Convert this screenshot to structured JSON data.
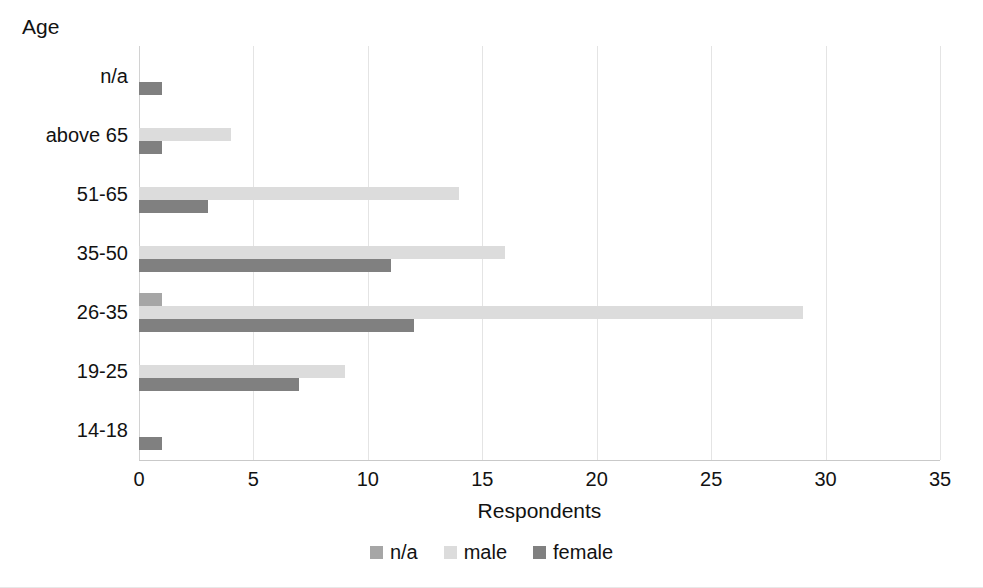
{
  "chart_data": {
    "type": "bar",
    "orientation": "horizontal",
    "title": "",
    "xlabel": "Respondents",
    "ylabel": "Age",
    "xlim": [
      0,
      35
    ],
    "xticks": [
      0,
      5,
      10,
      15,
      20,
      25,
      30,
      35
    ],
    "xtick_labels": [
      "0",
      "5",
      "10",
      "15",
      "20",
      "25",
      "30",
      "35"
    ],
    "grid": true,
    "grid_axis": "x",
    "legend_position": "bottom",
    "categories": [
      "n/a",
      "above 65",
      "51-65",
      "35-50",
      "26-35",
      "19-25",
      "14-18"
    ],
    "series": [
      {
        "name": "n/a",
        "color": "#a6a6a6",
        "values": [
          0,
          0,
          0,
          0,
          1,
          0,
          0
        ]
      },
      {
        "name": "male",
        "color": "#dcdcdc",
        "values": [
          0,
          4,
          14,
          16,
          29,
          9,
          0
        ]
      },
      {
        "name": "female",
        "color": "#808080",
        "values": [
          1,
          1,
          3,
          11,
          12,
          7,
          1
        ]
      }
    ]
  },
  "axes": {
    "y_title": "Age",
    "x_title": "Respondents"
  },
  "legend": {
    "items": [
      {
        "label": "n/a",
        "color": "#a6a6a6"
      },
      {
        "label": "male",
        "color": "#dcdcdc"
      },
      {
        "label": "female",
        "color": "#808080"
      }
    ]
  }
}
